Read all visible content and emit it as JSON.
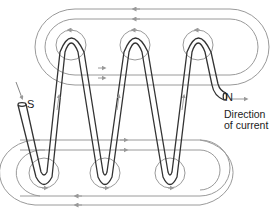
{
  "diagram": {
    "type": "solenoid magnetic field lines",
    "labels": {
      "south": "S",
      "north": "N",
      "direction_line1": "Direction",
      "direction_line2": "of current"
    },
    "colors": {
      "coil": "#333333",
      "field_lines": "#9a9a9a",
      "background": "#ffffff"
    }
  }
}
